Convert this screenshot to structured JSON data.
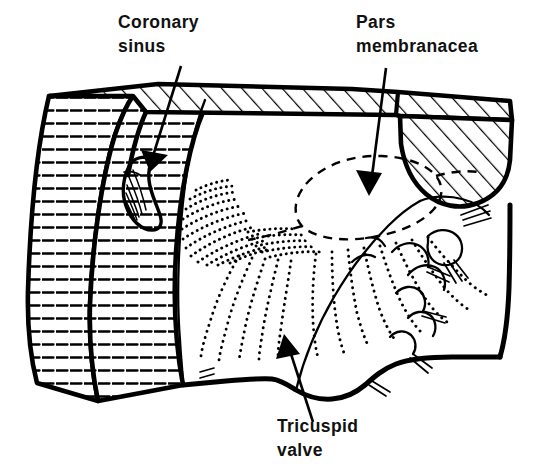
{
  "figure": {
    "kind": "anatomical-line-drawing",
    "background_color": "#ffffff",
    "ink_color": "#000000",
    "width": 534,
    "height": 475
  },
  "labels": [
    {
      "id": "coronary-sinus",
      "line1": "Coronary",
      "line2": "sinus",
      "text_x": 118,
      "text_y": 28,
      "leader_from": [
        181,
        66
      ],
      "leader_to": [
        150,
        166
      ],
      "arrow_direction": "down-left"
    },
    {
      "id": "pars-membranacea",
      "line1": "Pars",
      "line2": "membranacea",
      "text_x": 356,
      "text_y": 28,
      "leader_from": [
        386,
        68
      ],
      "leader_to": [
        370,
        190
      ],
      "arrow_direction": "down"
    },
    {
      "id": "tricuspid-valve",
      "line1": "Tricuspid",
      "line2": "valve",
      "text_x": 277,
      "text_y": 432,
      "leader_from": [
        313,
        422
      ],
      "leader_to": [
        284,
        338
      ],
      "arrow_direction": "up-left"
    }
  ],
  "structures": [
    {
      "id": "top-wall-band",
      "name": "cut myocardial wall (top)",
      "hatching": "diagonal"
    },
    {
      "id": "left-wall-band",
      "name": "cut myocardial wall (left)",
      "hatching": "horizontal"
    },
    {
      "id": "upper-right-muscle",
      "name": "cut muscle mass (upper right)",
      "hatching": "diagonal"
    },
    {
      "id": "coronary-sinus-ostium",
      "name": "coronary sinus opening",
      "hatching": "striated"
    },
    {
      "id": "pars-membranacea-outline",
      "name": "pars membranacea region",
      "hatching": "dashed-outline"
    },
    {
      "id": "trabeculae-stipple",
      "name": "trabeculated endocardial surface",
      "hatching": "stippled"
    },
    {
      "id": "tricuspid-leaflets",
      "name": "tricuspid valve leaflets",
      "hatching": "stippled-scalloped"
    },
    {
      "id": "chordae-tendineae",
      "name": "chordae tendineae",
      "hatching": "thin-lines"
    }
  ]
}
